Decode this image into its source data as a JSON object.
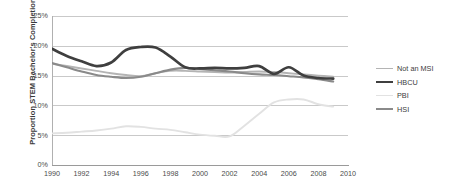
{
  "chart_data": {
    "type": "line",
    "title": "",
    "xlabel": "",
    "ylabel": "Proportion STEM Bachelor's Completions",
    "xlim": [
      1990,
      2010
    ],
    "ylim": [
      0,
      25
    ],
    "ytick_labels": [
      "0%",
      "5%",
      "10%",
      "15%",
      "20%",
      "25%"
    ],
    "ytick_values": [
      0,
      5,
      10,
      15,
      20,
      25
    ],
    "xtick_labels": [
      "1990",
      "1992",
      "1994",
      "1996",
      "1998",
      "2000",
      "2002",
      "2004",
      "2006",
      "2008",
      "2010"
    ],
    "xtick_values": [
      1990,
      1992,
      1994,
      1996,
      1998,
      2000,
      2002,
      2004,
      2006,
      2008,
      2010
    ],
    "grid": "horizontal",
    "legend_position": "right",
    "x": [
      1990,
      1991,
      1992,
      1993,
      1994,
      1995,
      1996,
      1997,
      1998,
      1999,
      2000,
      2001,
      2002,
      2003,
      2004,
      2005,
      2006,
      2007,
      2008,
      2009
    ],
    "series": [
      {
        "name": "Not an MSI",
        "color": "#b4b4b4",
        "width": 1.9,
        "values": [
          17.0,
          16.6,
          16.2,
          15.8,
          15.4,
          15.1,
          14.9,
          15.4,
          15.8,
          15.8,
          15.7,
          15.6,
          15.5,
          15.6,
          15.7,
          15.6,
          15.4,
          15.2,
          15.0,
          14.8
        ]
      },
      {
        "name": "HBCU",
        "color": "#3f3f3f",
        "width": 2.7,
        "values": [
          19.5,
          18.3,
          17.4,
          16.6,
          17.2,
          19.3,
          19.8,
          19.7,
          18.2,
          16.4,
          16.2,
          16.3,
          16.2,
          16.3,
          16.6,
          15.3,
          16.4,
          15.0,
          14.6,
          14.5
        ]
      },
      {
        "name": "PBI",
        "color": "#e2e2e2",
        "width": 1.9,
        "values": [
          5.3,
          5.4,
          5.6,
          5.8,
          6.1,
          6.5,
          6.4,
          6.1,
          5.9,
          5.5,
          5.1,
          4.9,
          4.8,
          6.6,
          8.6,
          10.5,
          11.0,
          11.0,
          10.2,
          9.8
        ]
      },
      {
        "name": "HSI",
        "color": "#8a8a8a",
        "width": 2.1,
        "values": [
          17.1,
          16.4,
          15.7,
          15.1,
          14.8,
          14.6,
          14.8,
          15.4,
          16.0,
          16.3,
          16.1,
          15.9,
          15.7,
          15.4,
          15.2,
          15.1,
          14.9,
          14.7,
          14.4,
          14.0
        ]
      }
    ]
  },
  "legend": {
    "items": [
      {
        "label": "Not an MSI"
      },
      {
        "label": "HBCU"
      },
      {
        "label": "PBI"
      },
      {
        "label": "HSI"
      }
    ]
  }
}
